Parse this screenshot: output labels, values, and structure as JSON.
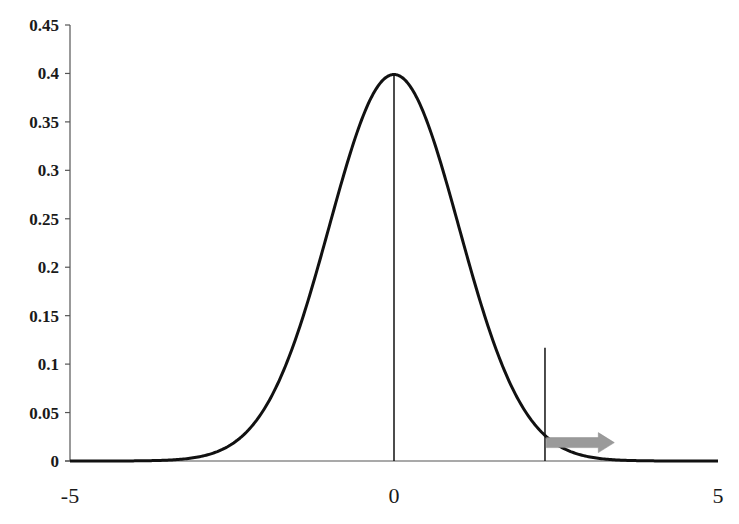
{
  "chart_data": {
    "type": "line",
    "title": "",
    "xlabel": "",
    "ylabel": "",
    "xlim": [
      -5,
      5
    ],
    "ylim": [
      0,
      0.45
    ],
    "grid": false,
    "legend": null,
    "x_ticks": [
      -5,
      0,
      5
    ],
    "x_tick_labels": [
      "-5",
      "0",
      "5"
    ],
    "y_ticks": [
      0,
      0.05,
      0.1,
      0.15,
      0.2,
      0.25,
      0.3,
      0.35,
      0.4,
      0.45
    ],
    "y_tick_labels": [
      "0",
      "0.05",
      "0.1",
      "0.15",
      "0.2",
      "0.25",
      "0.3",
      "0.35",
      "0.4",
      "0.45"
    ],
    "series": [
      {
        "name": "Standard normal density",
        "function": "exp(-x^2/2)/sqrt(2*pi)",
        "x": [
          -5,
          -4,
          -3,
          -2.5,
          -2,
          -1.5,
          -1,
          -0.5,
          0,
          0.5,
          1,
          1.5,
          2,
          2.5,
          3,
          4,
          5
        ],
        "values": [
          1.5e-06,
          0.00013,
          0.0044,
          0.0175,
          0.054,
          0.1295,
          0.242,
          0.352,
          0.399,
          0.352,
          0.242,
          0.1295,
          0.054,
          0.0175,
          0.0044,
          0.00013,
          1.5e-06
        ],
        "color": "#111111"
      }
    ],
    "annotations": [
      {
        "type": "vertical-line",
        "x": 0,
        "y_from": 0,
        "y_to": 0.399,
        "note": "mean line"
      },
      {
        "type": "vertical-line",
        "x": 2.33,
        "y_from": 0,
        "y_to": 0.117,
        "note": "critical value marker"
      },
      {
        "type": "arrow",
        "from_x": 2.35,
        "to_x": 3.4,
        "y": 0.02,
        "direction": "right",
        "color": "#9a9a9a",
        "note": "upper tail region"
      }
    ]
  },
  "colors": {
    "curve": "#111111",
    "axis": "#555555",
    "arrow": "#9a9a9a"
  }
}
